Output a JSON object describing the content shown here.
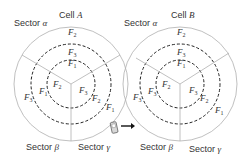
{
  "cells": [
    {
      "title_prefix": "Cell ",
      "title_var": "A",
      "cx": 71,
      "cy": 84,
      "sectors": {
        "alpha": {
          "prefix": "Sector ",
          "greek": "α"
        },
        "beta": {
          "prefix": "Sector ",
          "greek": "β"
        },
        "gamma": {
          "prefix": "Sector ",
          "greek": "γ"
        }
      },
      "labels": {
        "top_outer": "2",
        "top_mid": "3",
        "top_inner": "1",
        "left_outer": "3",
        "left_mid": "1",
        "left_inner": "2",
        "right_outer": "1",
        "right_mid": "2",
        "right_inner": "3"
      }
    },
    {
      "title_prefix": "Cell ",
      "title_var": "B",
      "cx": 180,
      "cy": 84,
      "sectors": {
        "alpha": {
          "prefix": "Sector ",
          "greek": "α"
        },
        "beta": {
          "prefix": "Sector ",
          "greek": "β"
        },
        "gamma": {
          "prefix": "Sector ",
          "greek": "γ"
        }
      },
      "labels": {
        "top_outer": "2",
        "top_mid": "3",
        "top_inner": "1",
        "left_outer": "3",
        "left_mid": "3",
        "left_inner": "2",
        "right_outer": "1",
        "right_mid": "2",
        "right_inner": "3"
      }
    }
  ],
  "freq_letter": "F",
  "colors": {
    "circle": "#b0b0b0",
    "dashed": "#222222",
    "text": "#333333",
    "arrow": "#111111"
  },
  "user": {
    "icon": "mobile-phone-icon",
    "arrow": "handover-arrow-icon"
  }
}
